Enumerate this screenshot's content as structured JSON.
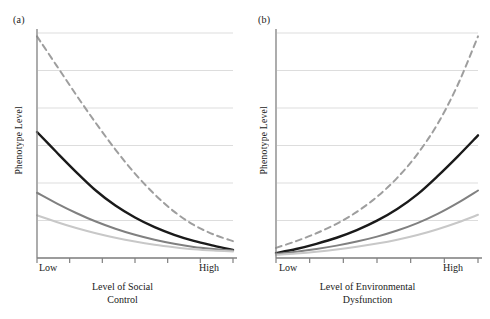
{
  "figure": {
    "width": 490,
    "height": 319,
    "background": "#ffffff"
  },
  "colors": {
    "axis": "#808080",
    "grid": "#d9d9d9",
    "text": "#1a1a1a",
    "series_black": "#1a1a1a",
    "series_mid_gray": "#808080",
    "series_light_gray": "#c8c8c8",
    "series_dashed_gray": "#9e9e9e"
  },
  "panels": [
    {
      "id": "a",
      "label": "(a)",
      "ylabel": "Phenotype Level",
      "xlabel_line1": "Level of Social",
      "xlabel_line2": "Control",
      "xtick_low": "Low",
      "xtick_high": "High"
    },
    {
      "id": "b",
      "label": "(b)",
      "ylabel": "Phenotype Level",
      "xlabel_line1": "Level of Environmental",
      "xlabel_line2": "Dysfunction",
      "xtick_low": "Low",
      "xtick_high": "High"
    }
  ],
  "chart_data": [
    {
      "type": "line",
      "panel": "a",
      "title": "(a)",
      "xlabel": "Level of Social Control",
      "ylabel": "Phenotype Level",
      "xlim": [
        0,
        1
      ],
      "ylim": [
        0,
        1
      ],
      "xtick_labels": [
        "Low",
        "High"
      ],
      "xtick_positions": [
        0,
        1
      ],
      "ytick_labels": [],
      "grid": "horizontal",
      "n_gridlines": 6,
      "legend": "none",
      "x": [
        0,
        0.1,
        0.2,
        0.3,
        0.4,
        0.5,
        0.6,
        0.7,
        0.8,
        0.9,
        1.0
      ],
      "series": [
        {
          "name": "dashed-gray",
          "style": "dashed",
          "color": "#9e9e9e",
          "width": 2.0,
          "values": [
            0.985,
            0.855,
            0.725,
            0.6,
            0.482,
            0.375,
            0.283,
            0.206,
            0.147,
            0.105,
            0.075
          ]
        },
        {
          "name": "solid-black",
          "style": "solid",
          "color": "#1a1a1a",
          "width": 2.4,
          "values": [
            0.56,
            0.47,
            0.382,
            0.3,
            0.233,
            0.18,
            0.137,
            0.103,
            0.076,
            0.055,
            0.036
          ]
        },
        {
          "name": "solid-mid-gray",
          "style": "solid",
          "color": "#808080",
          "width": 2.0,
          "values": [
            0.29,
            0.243,
            0.2,
            0.162,
            0.13,
            0.103,
            0.081,
            0.063,
            0.049,
            0.04,
            0.033
          ]
        },
        {
          "name": "solid-light-gray",
          "style": "solid",
          "color": "#c8c8c8",
          "width": 2.0,
          "values": [
            0.19,
            0.16,
            0.133,
            0.11,
            0.09,
            0.073,
            0.059,
            0.048,
            0.039,
            0.033,
            0.029
          ]
        }
      ]
    },
    {
      "type": "line",
      "panel": "b",
      "title": "(b)",
      "xlabel": "Level of Environmental Dysfunction",
      "ylabel": "Phenotype Level",
      "xlim": [
        0,
        1
      ],
      "ylim": [
        0,
        1
      ],
      "xtick_labels": [
        "Low",
        "High"
      ],
      "xtick_positions": [
        0,
        1
      ],
      "ytick_labels": [],
      "grid": "horizontal",
      "n_gridlines": 6,
      "legend": "none",
      "x": [
        0,
        0.1,
        0.2,
        0.3,
        0.4,
        0.5,
        0.6,
        0.7,
        0.8,
        0.9,
        1.0
      ],
      "series": [
        {
          "name": "dashed-gray",
          "style": "dashed",
          "color": "#9e9e9e",
          "width": 2.0,
          "values": [
            0.045,
            0.075,
            0.11,
            0.152,
            0.205,
            0.272,
            0.356,
            0.462,
            0.596,
            0.77,
            0.985
          ]
        },
        {
          "name": "solid-black",
          "style": "solid",
          "color": "#1a1a1a",
          "width": 2.4,
          "values": [
            0.022,
            0.04,
            0.063,
            0.09,
            0.124,
            0.166,
            0.218,
            0.283,
            0.364,
            0.452,
            0.545
          ]
        },
        {
          "name": "solid-mid-gray",
          "style": "solid",
          "color": "#808080",
          "width": 2.0,
          "values": [
            0.018,
            0.028,
            0.04,
            0.055,
            0.073,
            0.095,
            0.122,
            0.155,
            0.196,
            0.245,
            0.3
          ]
        },
        {
          "name": "solid-light-gray",
          "style": "solid",
          "color": "#c8c8c8",
          "width": 2.0,
          "values": [
            0.014,
            0.02,
            0.028,
            0.038,
            0.05,
            0.064,
            0.081,
            0.102,
            0.128,
            0.158,
            0.192
          ]
        }
      ]
    }
  ]
}
